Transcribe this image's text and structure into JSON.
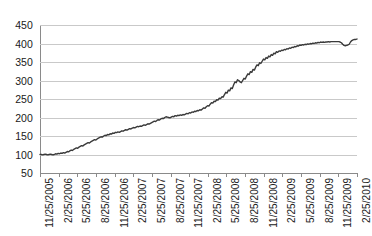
{
  "chart_data": {
    "type": "line",
    "title": "",
    "subtitle": "",
    "xlabel": "",
    "ylabel": "",
    "grid": true,
    "legend": false,
    "legend_position": "none",
    "series_color": "#3a3a3a",
    "grid_color": "#c9c9c9",
    "axis_color": "#8a8a8a",
    "ylim": [
      50,
      450
    ],
    "yticks": [
      450,
      400,
      350,
      300,
      250,
      200,
      150,
      100,
      50
    ],
    "xticks": [
      "11/25/2005",
      "2/25/2006",
      "5/25/2006",
      "8/25/2006",
      "11/25/2006",
      "2/25/2007",
      "5/25/2007",
      "8/25/2007",
      "11/25/2007",
      "2/25/2008",
      "5/25/2008",
      "8/25/2008",
      "11/25/2008",
      "2/25/2009",
      "5/25/2009",
      "8/25/2009",
      "11/25/2009",
      "2/25/2010"
    ],
    "x_start": "11/25/2005",
    "x_end": "2/25/2010",
    "series": [
      {
        "name": "value",
        "values": [
          100,
          100,
          99,
          100,
          101,
          100,
          99,
          100,
          101,
          100,
          99,
          100,
          102,
          101,
          103,
          102,
          104,
          103,
          105,
          104,
          106,
          108,
          107,
          110,
          112,
          111,
          114,
          116,
          118,
          117,
          120,
          122,
          124,
          123,
          126,
          128,
          130,
          132,
          131,
          134,
          136,
          138,
          140,
          139,
          142,
          144,
          146,
          148,
          147,
          150,
          152,
          151,
          154,
          153,
          156,
          155,
          158,
          157,
          160,
          159,
          161,
          160,
          162,
          164,
          163,
          165,
          167,
          166,
          168,
          170,
          169,
          171,
          173,
          172,
          174,
          176,
          175,
          177,
          176,
          178,
          180,
          179,
          181,
          183,
          182,
          184,
          186,
          188,
          190,
          189,
          192,
          194,
          193,
          196,
          198,
          197,
          200,
          202,
          201,
          200,
          199,
          201,
          203,
          202,
          205,
          204,
          206,
          205,
          207,
          206,
          208,
          207,
          209,
          211,
          210,
          213,
          212,
          215,
          214,
          217,
          216,
          219,
          218,
          221,
          220,
          223,
          226,
          225,
          229,
          232,
          231,
          236,
          240,
          239,
          244,
          243,
          248,
          247,
          252,
          251,
          256,
          255,
          262,
          268,
          266,
          274,
          272,
          280,
          278,
          288,
          296,
          294,
          302,
          300,
          296,
          294,
          300,
          306,
          304,
          312,
          318,
          316,
          324,
          322,
          330,
          328,
          336,
          342,
          340,
          348,
          346,
          352,
          358,
          356,
          362,
          360,
          366,
          364,
          370,
          368,
          374,
          372,
          378,
          376,
          380,
          379,
          382,
          381,
          384,
          383,
          386,
          385,
          388,
          387,
          390,
          389,
          392,
          391,
          394,
          393,
          396,
          395,
          397,
          396,
          398,
          397,
          399,
          398,
          400,
          399,
          401,
          400,
          402,
          401,
          403,
          402,
          404,
          403,
          404,
          403,
          404,
          404,
          405,
          404,
          405,
          405,
          405,
          405,
          405,
          405,
          405,
          404,
          402,
          398,
          395,
          394,
          395,
          396,
          398,
          404,
          408,
          410,
          411,
          411,
          412
        ]
      }
    ]
  }
}
